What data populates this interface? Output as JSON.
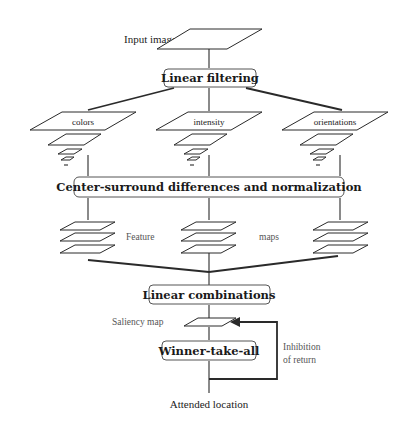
{
  "diagram": {
    "input_label": "Input image",
    "stages": {
      "linear_filtering": "Linear filtering",
      "center_surround": "Center-surround differences and normalization",
      "linear_combinations": "Linear combinations",
      "winner_take_all": "Winner-take-all"
    },
    "channels": [
      {
        "label": "colors"
      },
      {
        "label": "intensity"
      },
      {
        "label": "orientations"
      }
    ],
    "feature_maps_label_left": "Feature",
    "feature_maps_label_right": "maps",
    "saliency_label": "Saliency map",
    "inhibition_line1": "Inhibition",
    "inhibition_line2": "of return",
    "output_label": "Attended location"
  }
}
